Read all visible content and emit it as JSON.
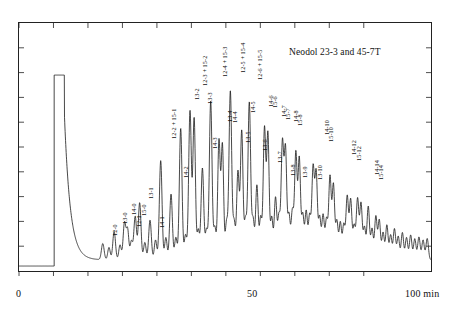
{
  "title": "Neodol 23-3 and 45-7T",
  "axes": {
    "x_ticks_labeled": [
      {
        "value": 0,
        "label": "0"
      },
      {
        "value": 50,
        "label": "50"
      },
      {
        "value": 100,
        "label": "100  min"
      }
    ],
    "x_unit": "min",
    "xlabel": "",
    "ylabel": "",
    "xlim": [
      0,
      100
    ],
    "ylim": [
      0,
      1
    ],
    "x_minor_tick_step": 10,
    "y_minor_tick_count": 9,
    "grid": false,
    "frame": true
  },
  "colors": {
    "trace": "#1a1a1a",
    "frame": "#222222",
    "text": "#111111",
    "background": "#ffffff"
  },
  "chart_data": {
    "type": "line",
    "title": "Neodol 23-3 and 45-7T",
    "subtitle": "",
    "xlabel": "min",
    "ylabel": "Detector response",
    "xlim": [
      0,
      100
    ],
    "ylim": [
      0,
      1.0
    ],
    "grid": false,
    "legend": null,
    "series": [
      {
        "name": "chromatogram",
        "baseline": 0.02,
        "solvent_peak": {
          "start": 10.2,
          "end": 13.2,
          "height": 0.79,
          "saturated": true
        },
        "tail": {
          "from": 13.2,
          "to": 22.0,
          "decay": "exponential",
          "start_height": 0.62,
          "end_height": 0.045
        },
        "peaks": [
          {
            "x": 24.3,
            "h": 0.065,
            "w": 0.55,
            "label": "12-0"
          },
          {
            "x": 26.1,
            "h": 0.05,
            "w": 0.5,
            "label": ""
          },
          {
            "x": 27.6,
            "h": 0.115,
            "w": 0.55,
            "label": "13-0"
          },
          {
            "x": 29.3,
            "h": 0.06,
            "w": 0.5,
            "label": ""
          },
          {
            "x": 30.6,
            "h": 0.15,
            "w": 0.55,
            "label": "14-0"
          },
          {
            "x": 31.5,
            "h": 0.12,
            "w": 0.5,
            "label": "12-1"
          },
          {
            "x": 32.6,
            "h": 0.075,
            "w": 0.5,
            "label": ""
          },
          {
            "x": 33.7,
            "h": 0.175,
            "w": 0.55,
            "label": "15-0"
          },
          {
            "x": 35.0,
            "h": 0.23,
            "w": 0.55,
            "label": "13-1"
          },
          {
            "x": 36.5,
            "h": 0.07,
            "w": 0.5,
            "label": ""
          },
          {
            "x": 38.0,
            "h": 0.16,
            "w": 0.55,
            "label": "14-1"
          },
          {
            "x": 39.6,
            "h": 0.08,
            "w": 0.5,
            "label": ""
          },
          {
            "x": 41.1,
            "h": 0.4,
            "w": 0.55,
            "label": "12-2 + 15-1"
          },
          {
            "x": 42.6,
            "h": 0.09,
            "w": 0.5,
            "label": ""
          },
          {
            "x": 44.1,
            "h": 0.265,
            "w": 0.55,
            "label": "14-2"
          },
          {
            "x": 45.5,
            "h": 0.09,
            "w": 0.5,
            "label": ""
          },
          {
            "x": 46.9,
            "h": 0.53,
            "w": 0.55,
            "label": "13-2"
          },
          {
            "x": 48.3,
            "h": 0.1,
            "w": 0.5,
            "label": ""
          },
          {
            "x": 49.6,
            "h": 0.6,
            "w": 0.55,
            "label": "12-3 + 15-2"
          },
          {
            "x": 50.8,
            "h": 0.57,
            "w": 0.52,
            "label": "13-3"
          },
          {
            "x": 52.0,
            "h": 0.12,
            "w": 0.5,
            "label": ""
          },
          {
            "x": 53.2,
            "h": 0.37,
            "w": 0.55,
            "label": "14-3"
          },
          {
            "x": 54.4,
            "h": 0.12,
            "w": 0.5,
            "label": ""
          },
          {
            "x": 55.6,
            "h": 0.64,
            "w": 0.55,
            "label": "12-4 + 15-3"
          },
          {
            "x": 56.8,
            "h": 0.13,
            "w": 0.5,
            "label": ""
          },
          {
            "x": 58.0,
            "h": 0.48,
            "w": 0.52,
            "label": "13-4"
          },
          {
            "x": 59.0,
            "h": 0.46,
            "w": 0.5,
            "label": "14-4"
          },
          {
            "x": 60.2,
            "h": 0.15,
            "w": 0.5,
            "label": ""
          },
          {
            "x": 61.3,
            "h": 0.68,
            "w": 0.55,
            "label": "12-5 + 15-4"
          },
          {
            "x": 62.4,
            "h": 0.15,
            "w": 0.5,
            "label": ""
          },
          {
            "x": 63.5,
            "h": 0.355,
            "w": 0.52,
            "label": "13-5"
          },
          {
            "x": 64.6,
            "h": 0.52,
            "w": 0.52,
            "label": "14-5"
          },
          {
            "x": 65.7,
            "h": 0.16,
            "w": 0.5,
            "label": ""
          },
          {
            "x": 66.8,
            "h": 0.635,
            "w": 0.55,
            "label": "12-6 + 15-5"
          },
          {
            "x": 67.9,
            "h": 0.16,
            "w": 0.5,
            "label": ""
          },
          {
            "x": 69.0,
            "h": 0.3,
            "w": 0.52,
            "label": "13-6"
          },
          {
            "x": 70.1,
            "h": 0.17,
            "w": 0.5,
            "label": ""
          },
          {
            "x": 71.2,
            "h": 0.53,
            "w": 0.52,
            "label": "14-6"
          },
          {
            "x": 72.2,
            "h": 0.505,
            "w": 0.5,
            "label": "15-6"
          },
          {
            "x": 73.3,
            "h": 0.17,
            "w": 0.5,
            "label": ""
          },
          {
            "x": 74.4,
            "h": 0.25,
            "w": 0.52,
            "label": "13-7"
          },
          {
            "x": 75.4,
            "h": 0.175,
            "w": 0.5,
            "label": ""
          },
          {
            "x": 76.4,
            "h": 0.47,
            "w": 0.52,
            "label": "14-7"
          },
          {
            "x": 77.3,
            "h": 0.44,
            "w": 0.5,
            "label": "15-7"
          },
          {
            "x": 78.3,
            "h": 0.18,
            "w": 0.5,
            "label": ""
          },
          {
            "x": 79.3,
            "h": 0.195,
            "w": 0.52,
            "label": "13-8"
          },
          {
            "x": 80.3,
            "h": 0.43,
            "w": 0.52,
            "label": "14-8"
          },
          {
            "x": 81.3,
            "h": 0.405,
            "w": 0.5,
            "label": "15-8"
          },
          {
            "x": 82.3,
            "h": 0.18,
            "w": 0.5,
            "label": ""
          },
          {
            "x": 83.3,
            "h": 0.195,
            "w": 0.52,
            "label": "13-9"
          },
          {
            "x": 84.3,
            "h": 0.175,
            "w": 0.5,
            "label": ""
          },
          {
            "x": 85.3,
            "h": 0.37,
            "w": 0.52,
            "label": ""
          },
          {
            "x": 86.2,
            "h": 0.345,
            "w": 0.5,
            "label": ""
          },
          {
            "x": 87.2,
            "h": 0.17,
            "w": 0.5,
            "label": ""
          },
          {
            "x": 88.2,
            "h": 0.18,
            "w": 0.52,
            "label": "13-10"
          },
          {
            "x": 89.2,
            "h": 0.16,
            "w": 0.5,
            "label": ""
          },
          {
            "x": 90.2,
            "h": 0.335,
            "w": 0.52,
            "label": "14-10"
          },
          {
            "x": 91.2,
            "h": 0.3,
            "w": 0.5,
            "label": "15-10"
          },
          {
            "x": 92.2,
            "h": 0.155,
            "w": 0.5,
            "label": ""
          },
          {
            "x": 93.2,
            "h": 0.15,
            "w": 0.5,
            "label": ""
          },
          {
            "x": 94.2,
            "h": 0.14,
            "w": 0.5,
            "label": ""
          },
          {
            "x": 95.2,
            "h": 0.255,
            "w": 0.52,
            "label": ""
          },
          {
            "x": 96.2,
            "h": 0.24,
            "w": 0.5,
            "label": ""
          },
          {
            "x": 97.2,
            "h": 0.135,
            "w": 0.5,
            "label": ""
          },
          {
            "x": 98.2,
            "h": 0.245,
            "w": 0.52,
            "label": "14-12"
          },
          {
            "x": 99.2,
            "h": 0.225,
            "w": 0.5,
            "label": "15-12"
          },
          {
            "x": 100.2,
            "h": 0.13,
            "w": 0.5,
            "label": ""
          },
          {
            "x": 101.3,
            "h": 0.215,
            "w": 0.52,
            "label": ""
          },
          {
            "x": 102.4,
            "h": 0.125,
            "w": 0.5,
            "label": ""
          },
          {
            "x": 103.5,
            "h": 0.175,
            "w": 0.5,
            "label": "14-14"
          },
          {
            "x": 104.5,
            "h": 0.16,
            "w": 0.5,
            "label": "15-14"
          },
          {
            "x": 105.6,
            "h": 0.11,
            "w": 0.5,
            "label": ""
          },
          {
            "x": 106.7,
            "h": 0.14,
            "w": 0.5,
            "label": ""
          },
          {
            "x": 107.8,
            "h": 0.1,
            "w": 0.5,
            "label": ""
          },
          {
            "x": 108.9,
            "h": 0.125,
            "w": 0.5,
            "label": ""
          },
          {
            "x": 110.0,
            "h": 0.095,
            "w": 0.5,
            "label": ""
          },
          {
            "x": 111.2,
            "h": 0.11,
            "w": 0.5,
            "label": ""
          },
          {
            "x": 112.4,
            "h": 0.09,
            "w": 0.5,
            "label": ""
          },
          {
            "x": 113.6,
            "h": 0.1,
            "w": 0.5,
            "label": ""
          },
          {
            "x": 114.8,
            "h": 0.085,
            "w": 0.5,
            "label": ""
          },
          {
            "x": 116.0,
            "h": 0.092,
            "w": 0.5,
            "label": ""
          },
          {
            "x": 117.2,
            "h": 0.08,
            "w": 0.5,
            "label": ""
          },
          {
            "x": 118.4,
            "h": 0.086,
            "w": 0.5,
            "label": ""
          }
        ]
      }
    ]
  },
  "peak_labels": [
    {
      "id": "12-0",
      "text": "12-0",
      "x": 112,
      "y": 236
    },
    {
      "id": "13-0",
      "text": "13-0",
      "x": 122,
      "y": 224
    },
    {
      "id": "14-0",
      "text": "14-0",
      "x": 131,
      "y": 215
    },
    {
      "id": "12-1",
      "text": "12-1",
      "x": 136,
      "y": 227
    },
    {
      "id": "15-0",
      "text": "15-0",
      "x": 141,
      "y": 216
    },
    {
      "id": "13-1",
      "text": "13-1",
      "x": 148,
      "y": 199
    },
    {
      "id": "14-1",
      "text": "14-1",
      "x": 159,
      "y": 228
    },
    {
      "id": "12-2+15-1",
      "text": "12-2 + 15-1",
      "x": 171,
      "y": 139
    },
    {
      "id": "14-2",
      "text": "14-2",
      "x": 183,
      "y": 178
    },
    {
      "id": "13-2",
      "text": "13-2",
      "x": 194,
      "y": 100
    },
    {
      "id": "12-3+15-2",
      "text": "12-3 + 15-2",
      "x": 202,
      "y": 86
    },
    {
      "id": "13-3",
      "text": "13-3",
      "x": 207,
      "y": 104
    },
    {
      "id": "14-3",
      "text": "14-3",
      "x": 212,
      "y": 149
    },
    {
      "id": "12-4+15-3",
      "text": "12-4 + 15-3",
      "x": 222,
      "y": 77
    },
    {
      "id": "13-4",
      "text": "13-4",
      "x": 227,
      "y": 122
    },
    {
      "id": "14-4",
      "text": "14-4",
      "x": 232,
      "y": 123
    },
    {
      "id": "12-5+15-4",
      "text": "12-5 + 15-4",
      "x": 240,
      "y": 73
    },
    {
      "id": "13-5",
      "text": "13-5",
      "x": 245,
      "y": 143
    },
    {
      "id": "14-5",
      "text": "14-5",
      "x": 250,
      "y": 113
    },
    {
      "id": "12-6+15-5",
      "text": "12-6 + 15-5",
      "x": 257,
      "y": 80
    },
    {
      "id": "13-6",
      "text": "13-6",
      "x": 262,
      "y": 151
    },
    {
      "id": "14-6",
      "text": "14-6",
      "x": 268,
      "y": 107
    },
    {
      "id": "15-6",
      "text": "15-6",
      "x": 272,
      "y": 108
    },
    {
      "id": "13-7",
      "text": "13-7",
      "x": 277,
      "y": 163
    },
    {
      "id": "14-7",
      "text": "14-7",
      "x": 281,
      "y": 117
    },
    {
      "id": "15-7",
      "text": "15-7",
      "x": 285,
      "y": 120
    },
    {
      "id": "13-8",
      "text": "13-8",
      "x": 290,
      "y": 176
    },
    {
      "id": "14-8",
      "text": "14-8",
      "x": 293,
      "y": 122
    },
    {
      "id": "15-8",
      "text": "15-8",
      "x": 297,
      "y": 126
    },
    {
      "id": "13-9",
      "text": "13-9",
      "x": 302,
      "y": 178
    },
    {
      "id": "13-10",
      "text": "13-10",
      "x": 317,
      "y": 180
    },
    {
      "id": "14-10",
      "text": "14-10",
      "x": 324,
      "y": 135
    },
    {
      "id": "15-10",
      "text": "15-10",
      "x": 328,
      "y": 142
    },
    {
      "id": "14-12",
      "text": "14-12",
      "x": 351,
      "y": 155
    },
    {
      "id": "15-12",
      "text": "15-12",
      "x": 356,
      "y": 161
    },
    {
      "id": "14-14",
      "text": "14-14",
      "x": 374,
      "y": 175
    },
    {
      "id": "15-14",
      "text": "15-14",
      "x": 378,
      "y": 180
    }
  ]
}
